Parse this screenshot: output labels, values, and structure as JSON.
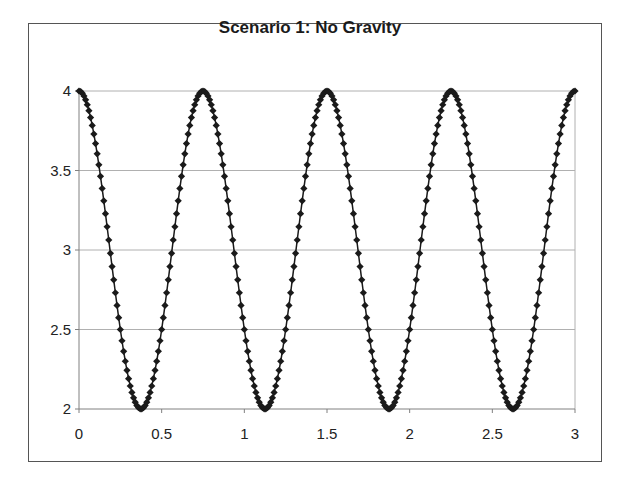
{
  "chart_data": {
    "type": "scatter",
    "title": "Scenario 1: No Gravity",
    "xlabel": "",
    "ylabel": "",
    "xlim": [
      0,
      3
    ],
    "ylim": [
      2,
      4
    ],
    "x_ticks": [
      "0",
      "0.5",
      "1",
      "1.5",
      "2",
      "2.5",
      "3"
    ],
    "y_ticks": [
      "2",
      "2.5",
      "3",
      "3.5",
      "4"
    ],
    "grid": {
      "horizontal": true,
      "vertical": false
    },
    "legend": null,
    "marker": "diamond",
    "line": true,
    "series": [
      {
        "name": "Series1",
        "color": "#1a1a1a",
        "description": "y = 3 + cos(2*pi*x/0.75), sampled x = 0..3 step 0.01 (301 points); peaks at 0, 0.75, 1.5, 2.25, 3; troughs at 0.375, 1.125, 1.875, 2.625",
        "x_start": 0,
        "x_end": 3,
        "x_step": 0.01,
        "amplitude": 1,
        "offset": 3,
        "period": 0.75,
        "key_points": [
          {
            "x": 0,
            "y": 4
          },
          {
            "x": 0.375,
            "y": 2
          },
          {
            "x": 0.75,
            "y": 4
          },
          {
            "x": 1.125,
            "y": 2
          },
          {
            "x": 1.5,
            "y": 4
          },
          {
            "x": 1.875,
            "y": 2
          },
          {
            "x": 2.25,
            "y": 4
          },
          {
            "x": 2.625,
            "y": 2
          },
          {
            "x": 3,
            "y": 4
          }
        ]
      }
    ]
  },
  "colors": {
    "frame": "#555555",
    "axis": "#808080",
    "grid": "#b0b0b0",
    "marker": "#1a1a1a"
  }
}
